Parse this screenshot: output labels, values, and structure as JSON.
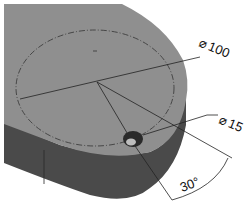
{
  "diagram": {
    "type": "isometric-part-drawing",
    "colors": {
      "top_face": "#8f8f8f",
      "side_face": "#4a4a4a",
      "side_face_dark": "#3a3a3a",
      "line": "#222222",
      "background": "#ffffff"
    },
    "dimensions": [
      {
        "id": "bolt-circle-diameter",
        "symbol": "⌀",
        "value": "100"
      },
      {
        "id": "hole-diameter",
        "symbol": "⌀",
        "value": "15"
      },
      {
        "id": "angle",
        "value": "30°"
      }
    ]
  }
}
